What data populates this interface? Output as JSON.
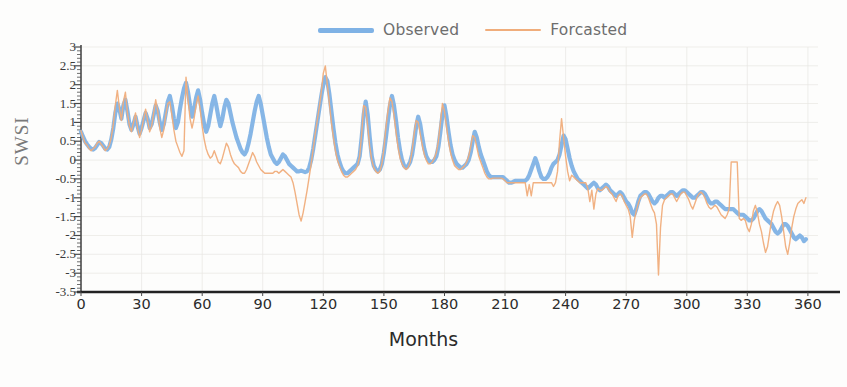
{
  "chart_data": {
    "type": "line",
    "title": "",
    "xlabel": "Months",
    "ylabel": "SWSI",
    "xlim": [
      0,
      365
    ],
    "ylim": [
      -3.5,
      3
    ],
    "xticks": [
      0,
      30,
      60,
      90,
      120,
      150,
      180,
      210,
      240,
      270,
      300,
      330,
      360
    ],
    "yticks": [
      3,
      2.5,
      2,
      1.5,
      1,
      0.5,
      0,
      -0.5,
      -1,
      -1.5,
      -2,
      -2.5,
      -3,
      -3.5
    ],
    "grid": true,
    "legend_position": "top-center",
    "colors": {
      "observed": "#7fb2e5",
      "forecasted": "#f0ad7b",
      "axis": "#4a4a4a",
      "grid": "#e8e6e2",
      "background": "#fdfdfc"
    },
    "series": [
      {
        "name": "Observed",
        "color": "#7fb2e5",
        "line_width": 4.2,
        "values": [
          0.75,
          0.62,
          0.5,
          0.42,
          0.35,
          0.3,
          0.28,
          0.32,
          0.4,
          0.48,
          0.45,
          0.38,
          0.3,
          0.28,
          0.35,
          0.55,
          0.85,
          1.25,
          1.5,
          1.35,
          1.1,
          1.45,
          1.6,
          1.3,
          0.95,
          0.8,
          0.95,
          1.15,
          0.9,
          0.7,
          0.85,
          1.05,
          1.25,
          1.1,
          0.85,
          0.95,
          1.2,
          1.45,
          1.3,
          1.0,
          0.8,
          0.95,
          1.25,
          1.55,
          1.7,
          1.45,
          1.1,
          0.85,
          1.0,
          1.35,
          1.65,
          1.9,
          2.05,
          1.8,
          1.45,
          1.15,
          1.35,
          1.65,
          1.85,
          1.6,
          1.25,
          0.95,
          0.75,
          0.9,
          1.2,
          1.5,
          1.7,
          1.45,
          1.15,
          0.9,
          1.1,
          1.4,
          1.6,
          1.5,
          1.25,
          1.0,
          0.8,
          0.6,
          0.45,
          0.3,
          0.2,
          0.15,
          0.25,
          0.45,
          0.7,
          1.0,
          1.3,
          1.55,
          1.7,
          1.5,
          1.2,
          0.9,
          0.6,
          0.35,
          0.15,
          0.05,
          -0.05,
          -0.1,
          -0.05,
          0.05,
          0.15,
          0.1,
          0.0,
          -0.1,
          -0.15,
          -0.2,
          -0.25,
          -0.3,
          -0.3,
          -0.28,
          -0.3,
          -0.32,
          -0.3,
          -0.2,
          0.0,
          0.3,
          0.65,
          1.0,
          1.35,
          1.7,
          2.0,
          2.2,
          2.1,
          1.75,
          1.3,
          0.85,
          0.45,
          0.15,
          -0.05,
          -0.2,
          -0.3,
          -0.35,
          -0.35,
          -0.3,
          -0.25,
          -0.2,
          -0.15,
          -0.1,
          0.1,
          0.6,
          1.2,
          1.55,
          1.2,
          0.6,
          0.1,
          -0.15,
          -0.25,
          -0.3,
          -0.25,
          -0.1,
          0.2,
          0.6,
          1.05,
          1.45,
          1.7,
          1.45,
          1.05,
          0.6,
          0.25,
          0.0,
          -0.15,
          -0.2,
          -0.15,
          -0.05,
          0.15,
          0.5,
          0.9,
          1.15,
          0.95,
          0.6,
          0.3,
          0.1,
          0.0,
          -0.05,
          -0.05,
          0.0,
          0.1,
          0.35,
          0.75,
          1.2,
          1.45,
          1.15,
          0.75,
          0.4,
          0.15,
          0.0,
          -0.1,
          -0.15,
          -0.2,
          -0.2,
          -0.15,
          -0.1,
          0.0,
          0.2,
          0.5,
          0.75,
          0.6,
          0.35,
          0.15,
          0.0,
          -0.15,
          -0.3,
          -0.4,
          -0.45,
          -0.45,
          -0.45,
          -0.45,
          -0.45,
          -0.45,
          -0.45,
          -0.5,
          -0.55,
          -0.6,
          -0.6,
          -0.58,
          -0.55,
          -0.55,
          -0.55,
          -0.55,
          -0.55,
          -0.55,
          -0.5,
          -0.4,
          -0.25,
          -0.1,
          0.05,
          -0.1,
          -0.3,
          -0.45,
          -0.5,
          -0.5,
          -0.45,
          -0.35,
          -0.2,
          -0.1,
          -0.05,
          0.0,
          0.15,
          0.4,
          0.65,
          0.55,
          0.3,
          0.05,
          -0.15,
          -0.3,
          -0.4,
          -0.5,
          -0.55,
          -0.6,
          -0.65,
          -0.7,
          -0.75,
          -0.7,
          -0.65,
          -0.6,
          -0.65,
          -0.75,
          -0.8,
          -0.75,
          -0.7,
          -0.65,
          -0.7,
          -0.8,
          -0.85,
          -0.9,
          -0.95,
          -0.9,
          -0.85,
          -0.9,
          -1.0,
          -1.1,
          -1.15,
          -1.25,
          -1.4,
          -1.45,
          -1.3,
          -1.1,
          -0.95,
          -0.9,
          -0.85,
          -0.85,
          -0.9,
          -1.0,
          -1.1,
          -1.15,
          -1.1,
          -1.0,
          -0.95,
          -0.95,
          -1.0,
          -0.95,
          -0.9,
          -0.85,
          -0.85,
          -0.9,
          -0.95,
          -0.9,
          -0.85,
          -0.8,
          -0.8,
          -0.85,
          -0.9,
          -0.95,
          -1.0,
          -1.0,
          -0.95,
          -0.9,
          -0.85,
          -0.85,
          -0.9,
          -1.0,
          -1.1,
          -1.15,
          -1.15,
          -1.1,
          -1.1,
          -1.15,
          -1.2,
          -1.25,
          -1.3,
          -1.3,
          -1.3,
          -1.3,
          -1.3,
          -1.35,
          -1.4,
          -1.45,
          -1.45,
          -1.45,
          -1.5,
          -1.55,
          -1.6,
          -1.6,
          -1.55,
          -1.45,
          -1.35,
          -1.3,
          -1.35,
          -1.45,
          -1.55,
          -1.6,
          -1.65,
          -1.7,
          -1.8,
          -1.9,
          -1.95,
          -1.9,
          -1.8,
          -1.7,
          -1.7,
          -1.75,
          -1.85,
          -1.95,
          -2.05,
          -2.1,
          -2.05,
          -2.0,
          -2.05,
          -2.15,
          -2.1
        ]
      },
      {
        "name": "Forcasted",
        "color": "#f0ad7b",
        "line_width": 1.4,
        "values": [
          0.78,
          0.6,
          0.45,
          0.4,
          0.3,
          0.25,
          0.3,
          0.35,
          0.45,
          0.5,
          0.42,
          0.35,
          0.25,
          0.3,
          0.4,
          0.6,
          0.95,
          1.45,
          1.85,
          1.4,
          1.05,
          1.55,
          1.8,
          1.25,
          0.9,
          0.75,
          1.0,
          1.25,
          0.85,
          0.6,
          0.8,
          1.1,
          1.35,
          1.05,
          0.75,
          0.9,
          1.25,
          1.6,
          1.3,
          0.85,
          0.6,
          0.8,
          1.2,
          1.5,
          1.55,
          1.2,
          0.8,
          0.5,
          0.35,
          0.2,
          0.1,
          0.25,
          2.2,
          1.6,
          1.1,
          0.85,
          1.1,
          1.45,
          1.7,
          1.35,
          0.9,
          0.55,
          0.3,
          0.15,
          0.05,
          0.1,
          0.25,
          0.1,
          -0.05,
          -0.1,
          0.05,
          0.25,
          0.45,
          0.35,
          0.15,
          0.0,
          -0.1,
          -0.15,
          -0.2,
          -0.3,
          -0.35,
          -0.35,
          -0.25,
          -0.1,
          0.05,
          0.2,
          0.1,
          -0.05,
          -0.15,
          -0.25,
          -0.3,
          -0.35,
          -0.35,
          -0.35,
          -0.35,
          -0.35,
          -0.3,
          -0.3,
          -0.35,
          -0.3,
          -0.25,
          -0.3,
          -0.35,
          -0.4,
          -0.45,
          -0.6,
          -0.85,
          -1.15,
          -1.45,
          -1.62,
          -1.4,
          -1.1,
          -0.8,
          -0.45,
          -0.1,
          0.3,
          0.7,
          1.05,
          1.4,
          1.8,
          2.3,
          2.5,
          2.0,
          1.5,
          1.0,
          0.6,
          0.25,
          0.0,
          -0.15,
          -0.3,
          -0.4,
          -0.45,
          -0.45,
          -0.4,
          -0.35,
          -0.3,
          -0.25,
          -0.15,
          0.1,
          0.7,
          1.45,
          1.4,
          0.9,
          0.35,
          0.0,
          -0.2,
          -0.3,
          -0.35,
          -0.3,
          -0.1,
          0.3,
          0.85,
          1.3,
          1.65,
          1.55,
          1.2,
          0.75,
          0.35,
          0.05,
          -0.1,
          -0.2,
          -0.25,
          -0.2,
          -0.05,
          0.25,
          0.7,
          1.05,
          1.0,
          0.7,
          0.4,
          0.15,
          0.0,
          -0.1,
          -0.1,
          -0.05,
          0.05,
          0.2,
          0.5,
          1.0,
          1.5,
          1.3,
          0.9,
          0.5,
          0.2,
          0.0,
          -0.15,
          -0.2,
          -0.25,
          -0.25,
          -0.2,
          -0.15,
          -0.05,
          0.1,
          0.35,
          0.65,
          0.6,
          0.35,
          0.1,
          -0.05,
          -0.2,
          -0.35,
          -0.45,
          -0.5,
          -0.5,
          -0.48,
          -0.48,
          -0.48,
          -0.48,
          -0.48,
          -0.5,
          -0.55,
          -0.6,
          -0.6,
          -0.6,
          -0.6,
          -0.6,
          -0.6,
          -0.6,
          -0.6,
          -0.6,
          -0.6,
          -0.95,
          -0.65,
          -0.95,
          -0.6,
          -0.6,
          -0.6,
          -0.6,
          -0.6,
          -0.6,
          -0.6,
          -0.6,
          -0.6,
          -0.6,
          -0.7,
          -0.6,
          -0.3,
          0.5,
          1.1,
          0.6,
          0.1,
          -0.3,
          -0.55,
          -0.4,
          -0.45,
          -0.5,
          -0.55,
          -0.6,
          -0.6,
          -0.6,
          -0.6,
          -0.75,
          -1.1,
          -0.8,
          -1.3,
          -0.9,
          -0.75,
          -0.8,
          -0.8,
          -0.75,
          -0.7,
          -0.75,
          -0.85,
          -0.9,
          -1.0,
          -1.1,
          -0.95,
          -0.9,
          -0.95,
          -1.1,
          -1.2,
          -1.3,
          -1.5,
          -2.05,
          -1.6,
          -1.35,
          -1.15,
          -1.0,
          -0.95,
          -0.9,
          -0.9,
          -1.0,
          -1.15,
          -1.3,
          -1.4,
          -1.7,
          -3.05,
          -1.8,
          -1.2,
          -1.05,
          -1.0,
          -0.95,
          -0.9,
          -0.9,
          -1.0,
          -1.1,
          -1.0,
          -0.9,
          -0.85,
          -0.85,
          -0.95,
          -1.05,
          -1.2,
          -1.3,
          -1.15,
          -1.0,
          -0.9,
          -0.85,
          -0.9,
          -1.0,
          -1.15,
          -1.25,
          -1.3,
          -1.25,
          -1.2,
          -1.25,
          -1.35,
          -1.45,
          -1.5,
          -1.55,
          -1.45,
          -1.3,
          -0.05,
          -0.05,
          -0.05,
          -0.05,
          -1.55,
          -1.6,
          -1.55,
          -1.6,
          -1.8,
          -1.9,
          -1.7,
          -1.35,
          -1.2,
          -1.4,
          -1.7,
          -1.9,
          -2.2,
          -2.45,
          -2.3,
          -1.95,
          -1.6,
          -1.35,
          -1.2,
          -1.1,
          -1.2,
          -1.5,
          -1.9,
          -2.3,
          -2.5,
          -2.2,
          -1.8,
          -1.5,
          -1.3,
          -1.15,
          -1.1,
          -1.05,
          -1.15,
          -1.0
        ]
      }
    ]
  },
  "legend": {
    "observed_label": "Observed",
    "forecasted_label": "Forcasted"
  },
  "axes": {
    "x_title": "Months",
    "y_title": "SWSI"
  }
}
